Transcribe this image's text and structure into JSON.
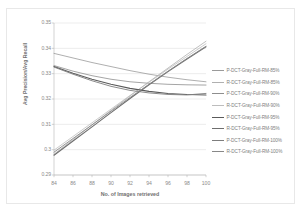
{
  "chart_data": {
    "type": "line",
    "title": "",
    "xlabel": "No. of Images retrieved",
    "ylabel": "Avg Precision/Avg Recall",
    "x": [
      84,
      86,
      88,
      90,
      92,
      94,
      96,
      98,
      100
    ],
    "xlim": [
      84,
      100
    ],
    "ylim": [
      0.29,
      0.35
    ],
    "xticks": [
      "84",
      "86",
      "88",
      "90",
      "92",
      "94",
      "96",
      "98",
      "100"
    ],
    "yticks": [
      "0.35",
      "0.34",
      "0.33",
      "0.32",
      "0.31",
      "0.3",
      "0.29"
    ],
    "grid": true,
    "legend_position": "right",
    "series": [
      {
        "name": "P-DCT-Gray-Full-RM-85%",
        "color": "#9a9a9a",
        "width": 0.8,
        "values": [
          0.338,
          0.3362,
          0.3344,
          0.3328,
          0.3312,
          0.3298,
          0.3286,
          0.3276,
          0.3268
        ]
      },
      {
        "name": "R-DCT-Gray-Full-RM-85%",
        "color": "#b0b0b0",
        "width": 0.8,
        "values": [
          0.2982,
          0.304,
          0.3098,
          0.3155,
          0.3212,
          0.3268,
          0.3322,
          0.3376,
          0.3428
        ]
      },
      {
        "name": "P-DCT-Gray-Full-RM-90%",
        "color": "#8e8e8e",
        "width": 0.8,
        "values": [
          0.3332,
          0.331,
          0.3292,
          0.3278,
          0.3268,
          0.3262,
          0.3258,
          0.3256,
          0.3255
        ]
      },
      {
        "name": "R-DCT-Gray-Full-RM-90%",
        "color": "#bdbdbd",
        "width": 0.8,
        "values": [
          0.2998,
          0.3052,
          0.3106,
          0.316,
          0.3214,
          0.3266,
          0.3318,
          0.3368,
          0.3418
        ]
      },
      {
        "name": "P-DCT-Gray-Full-RM-95%",
        "color": "#5a5a5a",
        "width": 1.1,
        "values": [
          0.3328,
          0.3302,
          0.3278,
          0.3258,
          0.3242,
          0.323,
          0.3222,
          0.3218,
          0.3216
        ]
      },
      {
        "name": "R-DCT-Gray-Full-RM-95%",
        "color": "#6e6e6e",
        "width": 1.1,
        "values": [
          0.2978,
          0.3034,
          0.309,
          0.3146,
          0.3202,
          0.3256,
          0.3308,
          0.3358,
          0.3406
        ]
      },
      {
        "name": "P-DCT-Gray-Full-RM-100%",
        "color": "#7d7d7d",
        "width": 0.9,
        "values": [
          0.3326,
          0.3298,
          0.3272,
          0.325,
          0.3234,
          0.3224,
          0.3218,
          0.3216,
          0.3222
        ]
      },
      {
        "name": "R-DCT-Gray-Full-RM-100%",
        "color": "#888888",
        "width": 0.9,
        "values": [
          0.299,
          0.3044,
          0.3098,
          0.3152,
          0.3206,
          0.3258,
          0.331,
          0.336,
          0.3408
        ]
      }
    ]
  }
}
